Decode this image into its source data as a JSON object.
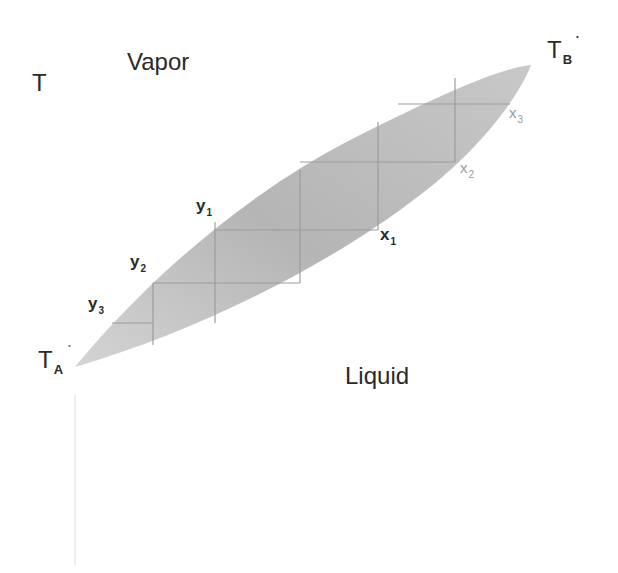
{
  "diagram": {
    "axis_label": "T",
    "regions": {
      "vapor": "Vapor",
      "liquid": "Liquid"
    },
    "endpoints": {
      "ta": {
        "main": "T",
        "sub": "A",
        "mark": "*"
      },
      "tb": {
        "main": "T",
        "sub": "B",
        "mark": "*"
      }
    },
    "vapor_points": [
      {
        "main": "y",
        "sub": "1"
      },
      {
        "main": "y",
        "sub": "2"
      },
      {
        "main": "y",
        "sub": "3"
      }
    ],
    "liquid_points": [
      {
        "main": "x",
        "sub": "1"
      },
      {
        "main": "x",
        "sub": "2"
      },
      {
        "main": "x",
        "sub": "3"
      }
    ],
    "colors": {
      "lens_fill": "#b9b9b9",
      "step_lines": "#9c9c9c",
      "text": "#2a2a2a",
      "faint_text": "#9a9a9a"
    }
  }
}
